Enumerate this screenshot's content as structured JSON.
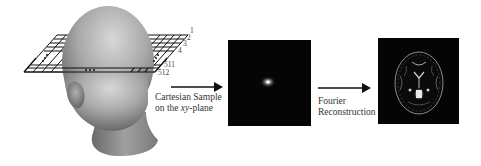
{
  "diagram": {
    "stages": [
      {
        "id": "head-with-sampling-plane",
        "caption": ""
      },
      {
        "id": "k-space-image",
        "caption": ""
      },
      {
        "id": "reconstructed-brain-image",
        "caption": ""
      }
    ],
    "arrows": [
      {
        "label_line1": "Cartesian Sample",
        "label_line2_prefix": "on the ",
        "label_line2_italic": "xy",
        "label_line2_suffix": "-plane"
      },
      {
        "label_line1": "Fourier",
        "label_line2": "Reconstruction"
      }
    ],
    "grid_line_labels": {
      "top": [
        "1",
        "2",
        "3",
        "4"
      ],
      "bottom": [
        "511",
        "512"
      ]
    },
    "colors": {
      "background": "#ffffff",
      "panel": "#050505",
      "arrow": "#111111",
      "head_light": "#c8c8c8",
      "head_dark": "#6a6a6a"
    }
  }
}
